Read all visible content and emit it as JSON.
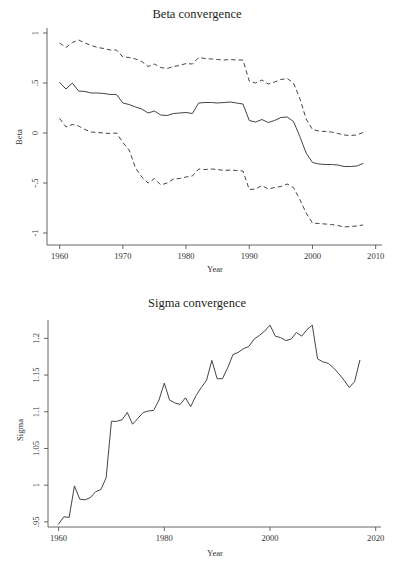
{
  "page": {
    "background": "#ffffff",
    "ink": "#3a3a3a",
    "width": 394,
    "height": 572
  },
  "chart_data": [
    {
      "id": "beta",
      "type": "line",
      "title": "Beta convergence",
      "xlabel": "Year",
      "ylabel": "Beta",
      "xlim": [
        1958,
        2011
      ],
      "ylim": [
        -1.12,
        1.05
      ],
      "xticks": [
        1960,
        1970,
        1980,
        1990,
        2000,
        2010
      ],
      "xticklabels": [
        "1960",
        "1970",
        "1980",
        "1990",
        "2000",
        "2010"
      ],
      "yticks": [
        1,
        0.5,
        0,
        -0.5,
        -1
      ],
      "yticklabels": [
        "1",
        ".5",
        "0",
        "-.5",
        "-1"
      ],
      "grid": false,
      "legend": "none",
      "x": [
        1960,
        1961,
        1962,
        1963,
        1964,
        1965,
        1966,
        1967,
        1968,
        1969,
        1970,
        1971,
        1972,
        1973,
        1974,
        1975,
        1976,
        1977,
        1978,
        1979,
        1980,
        1981,
        1982,
        1983,
        1984,
        1985,
        1986,
        1987,
        1988,
        1989,
        1990,
        1991,
        1992,
        1993,
        1994,
        1995,
        1996,
        1997,
        1998,
        1999,
        2000,
        2001,
        2002,
        2003,
        2004,
        2005,
        2006,
        2007,
        2008
      ],
      "series": [
        {
          "name": "Beta estimate",
          "style": "solid",
          "values": [
            0.505,
            0.44,
            0.5,
            0.42,
            0.415,
            0.4,
            0.4,
            0.395,
            0.385,
            0.385,
            0.3,
            0.285,
            0.26,
            0.24,
            0.2,
            0.22,
            0.18,
            0.175,
            0.195,
            0.2,
            0.205,
            0.195,
            0.3,
            0.305,
            0.305,
            0.3,
            0.305,
            0.31,
            0.3,
            0.29,
            0.125,
            0.11,
            0.135,
            0.105,
            0.125,
            0.155,
            0.16,
            0.115,
            -0.035,
            -0.2,
            -0.295,
            -0.31,
            -0.315,
            -0.315,
            -0.32,
            -0.335,
            -0.335,
            -0.33,
            -0.305
          ]
        },
        {
          "name": "Upper confidence band",
          "style": "dashed",
          "values": [
            0.9,
            0.855,
            0.905,
            0.93,
            0.9,
            0.875,
            0.855,
            0.845,
            0.83,
            0.83,
            0.76,
            0.755,
            0.74,
            0.715,
            0.665,
            0.69,
            0.655,
            0.645,
            0.665,
            0.675,
            0.695,
            0.69,
            0.755,
            0.745,
            0.74,
            0.735,
            0.73,
            0.735,
            0.73,
            0.73,
            0.52,
            0.5,
            0.53,
            0.49,
            0.51,
            0.535,
            0.545,
            0.5,
            0.345,
            0.14,
            0.035,
            0.02,
            0.015,
            0.01,
            -0.005,
            -0.02,
            -0.025,
            -0.02,
            0.005
          ]
        },
        {
          "name": "Lower confidence band",
          "style": "dashed",
          "values": [
            0.145,
            0.06,
            0.085,
            0.07,
            0.035,
            0.01,
            0.005,
            0.0,
            -0.005,
            0.0,
            -0.095,
            -0.17,
            -0.35,
            -0.44,
            -0.5,
            -0.455,
            -0.52,
            -0.5,
            -0.46,
            -0.455,
            -0.44,
            -0.43,
            -0.36,
            -0.365,
            -0.36,
            -0.365,
            -0.375,
            -0.37,
            -0.375,
            -0.38,
            -0.565,
            -0.56,
            -0.525,
            -0.56,
            -0.545,
            -0.535,
            -0.51,
            -0.545,
            -0.665,
            -0.8,
            -0.9,
            -0.905,
            -0.91,
            -0.915,
            -0.925,
            -0.94,
            -0.935,
            -0.93,
            -0.92
          ]
        }
      ]
    },
    {
      "id": "sigma",
      "type": "line",
      "title": "Sigma convergence",
      "xlabel": "Year",
      "ylabel": "Sigma",
      "xlim": [
        1958,
        2021
      ],
      "ylim": [
        0.943,
        1.225
      ],
      "xticks": [
        1960,
        1980,
        2000,
        2020
      ],
      "xticklabels": [
        "1960",
        "1980",
        "2000",
        "2020"
      ],
      "yticks": [
        0.95,
        1,
        1.05,
        1.1,
        1.15,
        1.2
      ],
      "yticklabels": [
        ".95",
        "1",
        "1.05",
        "1.1",
        "1.15",
        "1.2"
      ],
      "grid": false,
      "legend": "none",
      "x": [
        1960,
        1961,
        1962,
        1963,
        1964,
        1965,
        1966,
        1967,
        1968,
        1969,
        1970,
        1971,
        1972,
        1973,
        1974,
        1975,
        1976,
        1977,
        1978,
        1979,
        1980,
        1981,
        1982,
        1983,
        1984,
        1985,
        1986,
        1987,
        1988,
        1989,
        1990,
        1991,
        1992,
        1993,
        1994,
        1995,
        1996,
        1997,
        1998,
        1999,
        2000,
        2001,
        2002,
        2003,
        2004,
        2005,
        2006,
        2007,
        2008,
        2009,
        2010,
        2011,
        2012,
        2013,
        2014,
        2015,
        2016,
        2017
      ],
      "series": [
        {
          "name": "Sigma",
          "style": "solid",
          "values": [
            0.947,
            0.957,
            0.956,
            0.999,
            0.981,
            0.98,
            0.983,
            0.991,
            0.994,
            1.01,
            1.087,
            1.087,
            1.089,
            1.099,
            1.083,
            1.091,
            1.099,
            1.101,
            1.102,
            1.116,
            1.139,
            1.116,
            1.112,
            1.11,
            1.119,
            1.107,
            1.122,
            1.133,
            1.143,
            1.17,
            1.145,
            1.145,
            1.16,
            1.178,
            1.181,
            1.186,
            1.189,
            1.199,
            1.204,
            1.21,
            1.218,
            1.203,
            1.201,
            1.197,
            1.199,
            1.208,
            1.203,
            1.212,
            1.218,
            1.172,
            1.168,
            1.166,
            1.16,
            1.152,
            1.143,
            1.133,
            1.141,
            1.17
          ]
        }
      ]
    }
  ]
}
